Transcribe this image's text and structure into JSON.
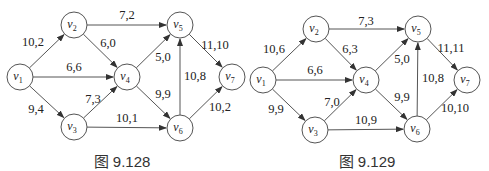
{
  "figures": [
    {
      "caption": "图 9.128",
      "caption_pos": [
        122,
        150
      ],
      "nodes": [
        {
          "id": "v1",
          "label": "v",
          "sub": "1",
          "x": 20,
          "y": 77
        },
        {
          "id": "v2",
          "label": "v",
          "sub": "2",
          "x": 74,
          "y": 25
        },
        {
          "id": "v3",
          "label": "v",
          "sub": "3",
          "x": 74,
          "y": 127
        },
        {
          "id": "v4",
          "label": "v",
          "sub": "4",
          "x": 127,
          "y": 77
        },
        {
          "id": "v5",
          "label": "v",
          "sub": "5",
          "x": 180,
          "y": 25
        },
        {
          "id": "v6",
          "label": "v",
          "sub": "6",
          "x": 180,
          "y": 128
        },
        {
          "id": "v7",
          "label": "v",
          "sub": "7",
          "x": 232,
          "y": 77
        }
      ],
      "edges": [
        {
          "from": "v1",
          "to": "v2",
          "label": "10,2",
          "lx": 33,
          "ly": 46
        },
        {
          "from": "v1",
          "to": "v4",
          "label": "6,6",
          "lx": 74,
          "ly": 71
        },
        {
          "from": "v1",
          "to": "v3",
          "label": "9,4",
          "lx": 36,
          "ly": 113
        },
        {
          "from": "v2",
          "to": "v5",
          "label": "7,2",
          "lx": 127,
          "ly": 19
        },
        {
          "from": "v2",
          "to": "v4",
          "label": "6,0",
          "lx": 108,
          "ly": 47
        },
        {
          "from": "v3",
          "to": "v4",
          "label": "7,3",
          "lx": 93,
          "ly": 103
        },
        {
          "from": "v3",
          "to": "v6",
          "label": "10,1",
          "lx": 127,
          "ly": 122
        },
        {
          "from": "v4",
          "to": "v5",
          "label": "5,0",
          "lx": 163,
          "ly": 61
        },
        {
          "from": "v4",
          "to": "v6",
          "label": "9,9",
          "lx": 163,
          "ly": 98
        },
        {
          "from": "v6",
          "to": "v5",
          "label": "10,8",
          "lx": 195,
          "ly": 80
        },
        {
          "from": "v5",
          "to": "v7",
          "label": "11,10",
          "lx": 215,
          "ly": 49
        },
        {
          "from": "v6",
          "to": "v7",
          "label": "10,2",
          "lx": 220,
          "ly": 111
        }
      ]
    },
    {
      "caption": "图 9.129",
      "caption_pos": [
        367,
        150
      ],
      "nodes": [
        {
          "id": "v1",
          "label": "v",
          "sub": "1",
          "x": 263,
          "y": 80
        },
        {
          "id": "v2",
          "label": "v",
          "sub": "2",
          "x": 316,
          "y": 29
        },
        {
          "id": "v3",
          "label": "v",
          "sub": "3",
          "x": 315,
          "y": 130
        },
        {
          "id": "v4",
          "label": "v",
          "sub": "4",
          "x": 366,
          "y": 80
        },
        {
          "id": "v5",
          "label": "v",
          "sub": "5",
          "x": 418,
          "y": 29
        },
        {
          "id": "v6",
          "label": "v",
          "sub": "6",
          "x": 417,
          "y": 129
        },
        {
          "id": "v7",
          "label": "v",
          "sub": "7",
          "x": 467,
          "y": 80
        }
      ],
      "edges": [
        {
          "from": "v1",
          "to": "v2",
          "label": "10,6",
          "lx": 274,
          "ly": 53
        },
        {
          "from": "v1",
          "to": "v4",
          "label": "6,6",
          "lx": 315,
          "ly": 74
        },
        {
          "from": "v1",
          "to": "v3",
          "label": "9,9",
          "lx": 276,
          "ly": 113
        },
        {
          "from": "v2",
          "to": "v5",
          "label": "7,3",
          "lx": 366,
          "ly": 25
        },
        {
          "from": "v2",
          "to": "v4",
          "label": "6,3",
          "lx": 350,
          "ly": 53
        },
        {
          "from": "v3",
          "to": "v4",
          "label": "7,0",
          "lx": 332,
          "ly": 106
        },
        {
          "from": "v3",
          "to": "v6",
          "label": "10,9",
          "lx": 366,
          "ly": 124
        },
        {
          "from": "v4",
          "to": "v5",
          "label": "5,0",
          "lx": 402,
          "ly": 63
        },
        {
          "from": "v4",
          "to": "v6",
          "label": "9,9",
          "lx": 402,
          "ly": 101
        },
        {
          "from": "v6",
          "to": "v5",
          "label": "10,8",
          "lx": 433,
          "ly": 82
        },
        {
          "from": "v5",
          "to": "v7",
          "label": "11,11",
          "lx": 451,
          "ly": 52
        },
        {
          "from": "v6",
          "to": "v7",
          "label": "10,10",
          "lx": 455,
          "ly": 112
        }
      ]
    }
  ],
  "style": {
    "node_radius": 13,
    "stroke": "#555555",
    "text": "#222222"
  }
}
